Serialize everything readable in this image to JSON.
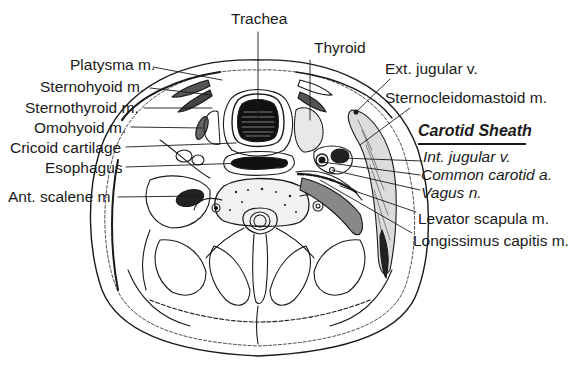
{
  "figure": {
    "ink_color": "#1a1a1a",
    "background": "#ffffff"
  },
  "labels_top": {
    "trachea": "Trachea",
    "thyroid": "Thyroid"
  },
  "labels_left": [
    {
      "id": "platysma",
      "text": "Platysma m."
    },
    {
      "id": "sternohyoid",
      "text": "Sternohyoid m."
    },
    {
      "id": "sternothyroid",
      "text": "Sternothyroid m."
    },
    {
      "id": "omohyoid",
      "text": "Omohyoid m."
    },
    {
      "id": "cricoid",
      "text": "Cricoid cartilage"
    },
    {
      "id": "esophagus",
      "text": "Esophagus"
    },
    {
      "id": "ant_scalene",
      "text": "Ant. scalene m."
    }
  ],
  "labels_right": [
    {
      "id": "ext_jugular",
      "text": "Ext. jugular v."
    },
    {
      "id": "scm",
      "text": "Sternocleidomastoid m."
    },
    {
      "id": "levator",
      "text": "Levator scapula m."
    },
    {
      "id": "longissimus",
      "text": "Longissimus capitis m."
    }
  ],
  "carotid_sheath": {
    "heading": "Carotid Sheath",
    "items": [
      {
        "id": "int_jugular",
        "text": "Int. jugular v."
      },
      {
        "id": "common_carotid",
        "text": "Common carotid a."
      },
      {
        "id": "vagus",
        "text": "Vagus n."
      }
    ]
  }
}
